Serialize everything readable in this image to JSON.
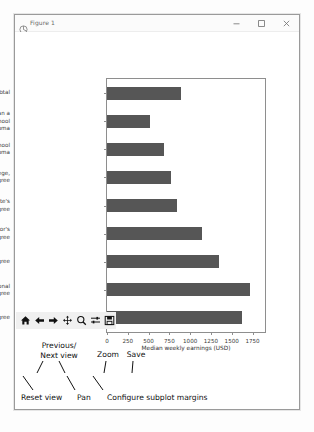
{
  "window": {
    "title": "Figure 1",
    "icon": "matplotlib-figure-icon",
    "controls": [
      {
        "name": "minimize-button",
        "glyph": "minimize-icon"
      },
      {
        "name": "maximize-button",
        "glyph": "maximize-icon"
      },
      {
        "name": "close-button",
        "glyph": "close-icon"
      }
    ]
  },
  "toolbar": {
    "buttons": [
      {
        "name": "home-button",
        "icon": "home-icon",
        "tooltip": "Reset view"
      },
      {
        "name": "back-button",
        "icon": "arrow-left-icon",
        "tooltip": "Previous view"
      },
      {
        "name": "forward-button",
        "icon": "arrow-right-icon",
        "tooltip": "Next view"
      },
      {
        "name": "pan-button",
        "icon": "move-cross-icon",
        "tooltip": "Pan"
      },
      {
        "name": "zoom-button",
        "icon": "magnifier-icon",
        "tooltip": "Zoom"
      },
      {
        "name": "subplots-button",
        "icon": "sliders-icon",
        "tooltip": "Configure subplot margins"
      },
      {
        "name": "save-button",
        "icon": "floppy-disk-icon",
        "tooltip": "Save"
      }
    ]
  },
  "annotations": {
    "previous_next": "Previous/\nNext view",
    "zoom": "Zoom",
    "save": "Save",
    "reset_view": "Reset view",
    "pan": "Pan",
    "subplot_margins": "Configure subplot margins"
  },
  "chart_data": {
    "type": "bar",
    "orientation": "horizontal",
    "title": "",
    "xlabel": "Median weekly earnings (USD)",
    "ylabel": "",
    "xlim": [
      0,
      1900
    ],
    "xticks": [
      0,
      250,
      500,
      750,
      1000,
      1250,
      1500,
      1750
    ],
    "grid": false,
    "bar_color": "#565656",
    "categories": [
      "Total",
      "Less than a\nhigh school\ndiploma",
      "High school\ndiploma",
      "Some college,\nno degree",
      "Associate's\ndegree",
      "Bachelor's\ndegree",
      "Master's degree",
      "Professional\ndegree",
      "Doctoral degree"
    ],
    "values": [
      887,
      520,
      689,
      774,
      836,
      1137,
      1341,
      1714,
      1623
    ]
  }
}
